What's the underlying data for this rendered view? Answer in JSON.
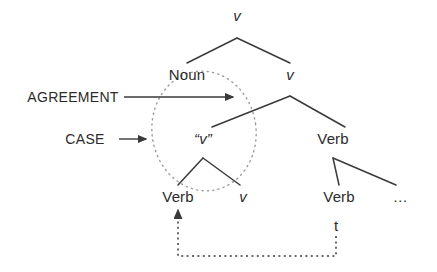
{
  "figure": {
    "type": "syntax-tree-diagram",
    "background_color": "#ffffff",
    "line_color": "#3a3a3a",
    "text_color": "#2b2b2b",
    "dotted_color": "#9a9a9a"
  },
  "nodes": {
    "root_v": {
      "text": "v",
      "style": "italic",
      "x": 237,
      "y": 15
    },
    "noun": {
      "text": "Noun",
      "style": "roman",
      "x": 187,
      "y": 74
    },
    "level2_v": {
      "text": "v",
      "style": "italic",
      "x": 290,
      "y": 74
    },
    "quoted_v": {
      "text": "“v”",
      "style": "italic",
      "x": 203,
      "y": 138
    },
    "verb_right_upper": {
      "text": "Verb",
      "style": "roman",
      "x": 333,
      "y": 138
    },
    "verb_lower_left": {
      "text": "Verb",
      "style": "roman",
      "x": 178,
      "y": 196
    },
    "lower_v": {
      "text": "v",
      "style": "italic",
      "x": 243,
      "y": 196
    },
    "verb_lower_right": {
      "text": "Verb",
      "style": "roman",
      "x": 339,
      "y": 196
    },
    "ellipsis": {
      "text": "…",
      "style": "roman",
      "x": 401,
      "y": 196
    },
    "trace_t": {
      "text": "t",
      "style": "roman",
      "x": 336,
      "y": 225
    }
  },
  "annotations": {
    "agreement": {
      "label": "AGREEMENT",
      "x": 73,
      "y": 97
    },
    "case": {
      "label": "CASE",
      "x": 85,
      "y": 139
    }
  },
  "arrows": {
    "agreement_arrow": {
      "from_x": 124,
      "from_y": 97,
      "to_x": 233,
      "to_y": 97
    },
    "case_arrow": {
      "from_x": 119,
      "from_y": 139,
      "to_x": 146,
      "to_y": 139
    },
    "movement_arrow": {
      "from_x": 336,
      "from_y": 236,
      "corner1_x": 336,
      "corner1_y": 256,
      "corner2_x": 178,
      "corner2_y": 256,
      "to_x": 178,
      "to_y": 210
    }
  },
  "branches": [
    {
      "name": "root-to-noun",
      "x1": 237,
      "y1": 38,
      "x2": 187,
      "y2": 63
    },
    {
      "name": "root-to-level2v",
      "x1": 237,
      "y1": 38,
      "x2": 290,
      "y2": 63
    },
    {
      "name": "level2v-to-quotedv",
      "x1": 290,
      "y1": 96,
      "x2": 212,
      "y2": 127
    },
    {
      "name": "level2v-to-verbright",
      "x1": 290,
      "y1": 96,
      "x2": 345,
      "y2": 127
    },
    {
      "name": "quotedv-to-verb",
      "x1": 203,
      "y1": 158,
      "x2": 178,
      "y2": 185
    },
    {
      "name": "quotedv-to-v",
      "x1": 203,
      "y1": 158,
      "x2": 240,
      "y2": 185
    },
    {
      "name": "verbright-to-verb",
      "x1": 333,
      "y1": 158,
      "x2": 339,
      "y2": 185
    },
    {
      "name": "verbright-to-ellipsis",
      "x1": 333,
      "y1": 158,
      "x2": 396,
      "y2": 185
    }
  ],
  "ellipse": {
    "name": "dotted-scope-ellipse",
    "cx": 204,
    "cy": 131,
    "rx": 52,
    "ry": 60,
    "rotation": -8
  }
}
